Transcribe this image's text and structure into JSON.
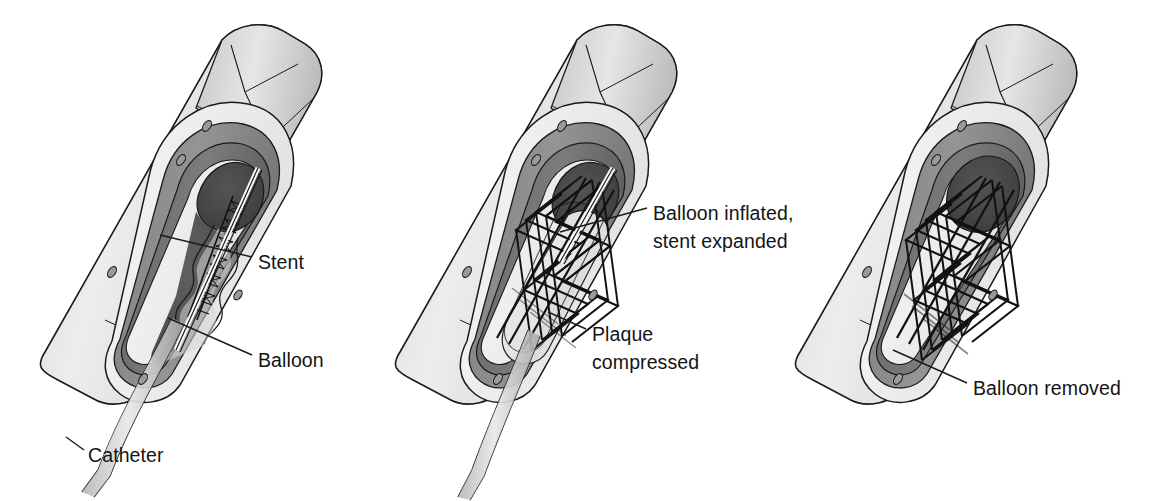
{
  "figure": {
    "background_color": "#ffffff",
    "line_color": "#1a1a1a",
    "panel_count": 3
  },
  "palette": {
    "outer_wall_light": "#e3e3e3",
    "outer_wall_shade": "#c9c9c9",
    "media_mid_gray": "#8e8e8e",
    "media_dark_gray": "#6f6f6f",
    "lumen_dark": "#4a4a4a",
    "lumen_darkest": "#3c3c3c",
    "intima_pale": "#f2f2f2",
    "plaque_fill": "#d8d8d8",
    "balloon_fill": "#ececec",
    "stent_wire": "#111111",
    "catheter_fill": "#d0d0d0",
    "text_color": "#141414"
  },
  "panels": [
    {
      "id": "panel-1",
      "stage": "Stent on deflated balloon positioned across plaque",
      "stent_state": "crimped",
      "balloon_state": "deflated",
      "catheter_present": true,
      "labels": [
        {
          "id": "stent",
          "text": "Stent",
          "x": 258,
          "y": 262,
          "lines": [
            "Stent"
          ]
        },
        {
          "id": "balloon",
          "text": "Balloon",
          "x": 258,
          "y": 360,
          "lines": [
            "Balloon"
          ]
        },
        {
          "id": "catheter",
          "text": "Catheter",
          "x": 88,
          "y": 455,
          "lines": [
            "Catheter"
          ]
        }
      ]
    },
    {
      "id": "panel-2",
      "stage": "Balloon inflated, stent expanded, plaque compressed",
      "stent_state": "expanded",
      "balloon_state": "inflated",
      "catheter_present": true,
      "labels": [
        {
          "id": "balloon-inflated",
          "text": "Balloon inflated, stent expanded",
          "x": 653,
          "y": 213,
          "lines": [
            "Balloon inflated,",
            "stent expanded"
          ]
        },
        {
          "id": "plaque-compressed",
          "text": "Plaque compressed",
          "x": 592,
          "y": 334,
          "lines": [
            "Plaque",
            "compressed"
          ]
        }
      ]
    },
    {
      "id": "panel-3",
      "stage": "Balloon removed, stent remains expanded",
      "stent_state": "expanded",
      "balloon_state": "removed",
      "catheter_present": false,
      "labels": [
        {
          "id": "balloon-removed",
          "text": "Balloon removed",
          "x": 973,
          "y": 388,
          "lines": [
            "Balloon removed"
          ]
        }
      ]
    }
  ]
}
